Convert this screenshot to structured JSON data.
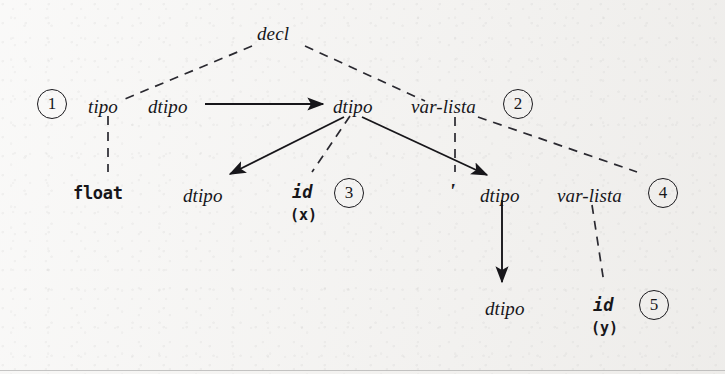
{
  "diagram": {
    "background_color": "#f2f1ef",
    "ink_color": "#17161a",
    "canvas": {
      "width": 725,
      "height": 374
    }
  },
  "nodes": {
    "decl": {
      "label": "decl",
      "kind": "nonterminal",
      "x": 257,
      "y": 24
    },
    "tipo": {
      "label": "tipo",
      "kind": "nonterminal",
      "x": 88,
      "y": 97
    },
    "dtipo_a": {
      "label": "dtipo",
      "kind": "nonterminal",
      "x": 148,
      "y": 97
    },
    "dtipo_b": {
      "label": "dtipo",
      "kind": "nonterminal",
      "x": 333,
      "y": 97
    },
    "varlista_1": {
      "label": "var-lista",
      "kind": "nonterminal",
      "x": 411,
      "y": 97
    },
    "float": {
      "label": "float",
      "kind": "terminal",
      "x": 73,
      "y": 185
    },
    "dtipo_c": {
      "label": "dtipo",
      "kind": "nonterminal",
      "x": 183,
      "y": 186
    },
    "id_x": {
      "label": "id",
      "kind": "terminal-italic",
      "x": 292,
      "y": 184
    },
    "id_x_lex": {
      "label": "(x)",
      "kind": "lexeme",
      "x": 290,
      "y": 208
    },
    "comma": {
      "label": "'",
      "kind": "comma",
      "x": 449,
      "y": 180
    },
    "dtipo_d": {
      "label": "dtipo",
      "kind": "nonterminal",
      "x": 480,
      "y": 186
    },
    "varlista_2": {
      "label": "var-lista",
      "kind": "nonterminal",
      "x": 557,
      "y": 186
    },
    "dtipo_e": {
      "label": "dtipo",
      "kind": "nonterminal",
      "x": 485,
      "y": 299
    },
    "id_y": {
      "label": "id",
      "kind": "terminal-italic",
      "x": 593,
      "y": 297
    },
    "id_y_lex": {
      "label": "(y)",
      "kind": "lexeme",
      "x": 591,
      "y": 321
    }
  },
  "step_markers": [
    {
      "label": "1",
      "x": 37,
      "y": 89
    },
    {
      "label": "2",
      "x": 503,
      "y": 89
    },
    {
      "label": "3",
      "x": 334,
      "y": 178
    },
    {
      "label": "4",
      "x": 648,
      "y": 178
    },
    {
      "label": "5",
      "x": 639,
      "y": 290
    }
  ],
  "edges": {
    "dashed": [
      {
        "name": "decl-to-tipo",
        "x1": 252,
        "y1": 46,
        "x2": 120,
        "y2": 101
      },
      {
        "name": "decl-to-varlista1",
        "x1": 305,
        "y1": 46,
        "x2": 425,
        "y2": 101
      },
      {
        "name": "tipo-to-float",
        "x1": 108,
        "y1": 116,
        "x2": 108,
        "y2": 172
      },
      {
        "name": "dtipo-b-to-idx",
        "x1": 350,
        "y1": 116,
        "x2": 312,
        "y2": 172
      },
      {
        "name": "varlista1-to-comma",
        "x1": 455,
        "y1": 117,
        "x2": 455,
        "y2": 172
      },
      {
        "name": "varlista1-to-varlista2",
        "x1": 478,
        "y1": 117,
        "x2": 637,
        "y2": 172
      },
      {
        "name": "varlista2-to-idy",
        "x1": 592,
        "y1": 205,
        "x2": 604,
        "y2": 283
      }
    ],
    "solid_arrows": [
      {
        "name": "dtipo-a-to-dtipo-b",
        "x1": 205,
        "y1": 104,
        "x2": 327,
        "y2": 104
      },
      {
        "name": "dtipo-b-to-dtipo-c",
        "x1": 342,
        "y1": 117,
        "x2": 228,
        "y2": 176
      },
      {
        "name": "dtipo-b-to-dtipo-d",
        "x1": 360,
        "y1": 117,
        "x2": 489,
        "y2": 177
      },
      {
        "name": "dtipo-d-to-dtipo-e",
        "x1": 502,
        "y1": 200,
        "x2": 502,
        "y2": 285
      }
    ]
  },
  "bottom_rule": {
    "visible": true
  }
}
